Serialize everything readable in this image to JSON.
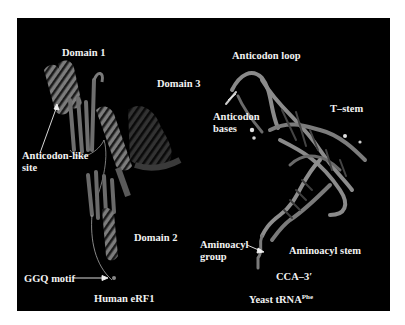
{
  "figure": {
    "background_color": "#000000",
    "ribbon_color": "#8a8a8a",
    "label_color": "#f2f2f2",
    "left_structure": {
      "caption": "Human eRF1",
      "labels": {
        "domain1": "Domain 1",
        "domain2": "Domain 2",
        "domain3": "Domain 3",
        "anticodon_like_line1": "Anticodon-like",
        "anticodon_like_line2": "site",
        "ggq_motif": "GGQ motif"
      }
    },
    "right_structure": {
      "caption_main": "Yeast  tRNA",
      "caption_sup": "Phe",
      "labels": {
        "anticodon_loop": "Anticodon loop",
        "anticodon_bases_line1": "Anticodon",
        "anticodon_bases_line2": "bases",
        "t_stem": "T–stem",
        "aminoacyl_group_line1": "Aminoacyl",
        "aminoacyl_group_line2": "group",
        "aminoacyl_stem": "Aminoacyl stem",
        "cca_3": "CCA–3′"
      }
    }
  }
}
